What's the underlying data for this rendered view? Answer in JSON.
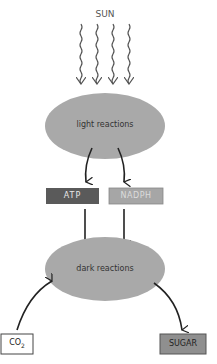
{
  "diagram": {
    "sun_label": "SUN",
    "light_reactions": "light reactions",
    "dark_reactions": "dark reactions",
    "atp_label": "ATP",
    "nadph_label": "NADPH",
    "co2_label": "CO",
    "co2_sub": "2",
    "sugar_label": "SUGAR",
    "colors": {
      "ellipse": "#a9a9a9",
      "atp_box": "#5a5a5a",
      "nadph_box": "#a6a6a6",
      "sugar_box": "#8f8f8f",
      "arrow": "#222222",
      "sun_rays": "#555555"
    }
  }
}
